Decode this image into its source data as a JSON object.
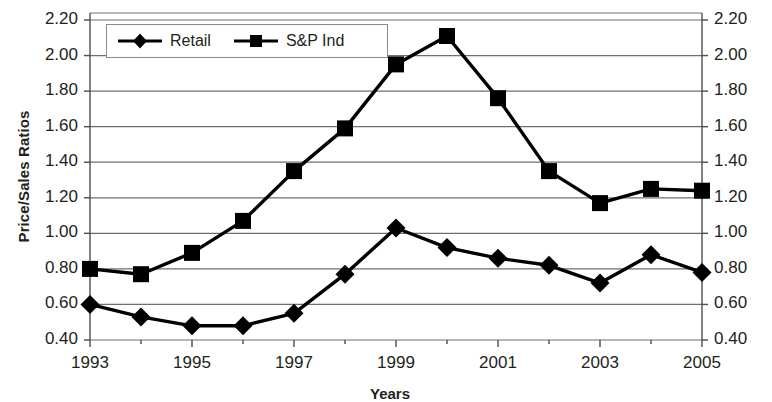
{
  "chart_data": {
    "type": "line",
    "title": "",
    "xlabel": "Years",
    "ylabel": "Price/Sales Ratios",
    "x": [
      1993,
      1994,
      1995,
      1996,
      1997,
      1998,
      1999,
      2000,
      2001,
      2002,
      2003,
      2004,
      2005
    ],
    "categories": [
      "1993",
      "1994",
      "1995",
      "1996",
      "1997",
      "1998",
      "1999",
      "2000",
      "2001",
      "2002",
      "2003",
      "2004",
      "2005"
    ],
    "xtick_labels": [
      "1993",
      "1995",
      "1997",
      "1999",
      "2001",
      "2003",
      "2005"
    ],
    "xtick_values": [
      1993,
      1995,
      1997,
      1999,
      2001,
      2003,
      2005
    ],
    "ytick_labels": [
      "0.40",
      "0.60",
      "0.80",
      "1.00",
      "1.20",
      "1.40",
      "1.60",
      "1.80",
      "2.00",
      "2.20"
    ],
    "ytick_values": [
      0.4,
      0.6,
      0.8,
      1.0,
      1.2,
      1.4,
      1.6,
      1.8,
      2.0,
      2.2
    ],
    "ylim": [
      0.4,
      2.2
    ],
    "xlim": [
      1993,
      2005
    ],
    "grid": true,
    "grid_axis": "y",
    "legend_position": "top-left-inside",
    "dual_y_axis": true,
    "series": [
      {
        "name": "Retail",
        "marker": "diamond",
        "color": "#000000",
        "values": [
          0.6,
          0.53,
          0.48,
          0.48,
          0.55,
          0.77,
          1.03,
          0.92,
          0.86,
          0.82,
          0.72,
          0.88,
          0.78
        ]
      },
      {
        "name": "S&P Ind",
        "marker": "square",
        "color": "#000000",
        "values": [
          0.8,
          0.77,
          0.89,
          1.07,
          1.35,
          1.59,
          1.95,
          2.11,
          1.76,
          1.35,
          1.17,
          1.25,
          1.24
        ]
      }
    ]
  },
  "axis": {
    "y_title": "Price/Sales Ratios",
    "x_title": "Years"
  },
  "legend": {
    "items": [
      {
        "label": "Retail"
      },
      {
        "label": "S&P Ind"
      }
    ]
  },
  "colors": {
    "line": "#000000",
    "grid": "#6f6f6f",
    "axis": "#4d4d4d",
    "text": "#231f20",
    "background": "#ffffff"
  }
}
